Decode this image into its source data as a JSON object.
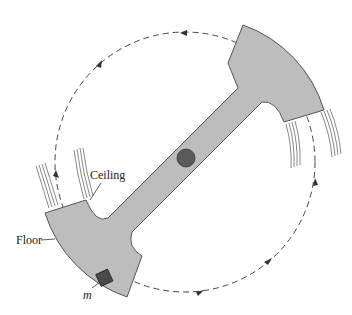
{
  "figure": {
    "labels": {
      "ceiling": "Ceiling",
      "floor": "Floor",
      "mass": "m"
    },
    "colors": {
      "structure_fill": "#bdbdbd",
      "structure_stroke": "#555555",
      "orbit_stroke": "#444444",
      "object_fill": "#555555"
    },
    "orbit": {
      "style": "dashed",
      "direction_arrows": 4
    }
  }
}
